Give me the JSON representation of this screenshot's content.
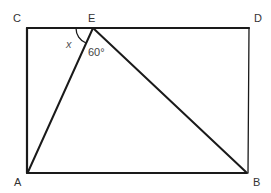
{
  "diagram": {
    "type": "geometry",
    "shape": "rectangle with inscribed triangle",
    "points": {
      "C": {
        "label": "C",
        "x": 27,
        "y": 28
      },
      "E": {
        "label": "E",
        "x": 93,
        "y": 28
      },
      "D": {
        "label": "D",
        "x": 249,
        "y": 28
      },
      "A": {
        "label": "A",
        "x": 27,
        "y": 173
      },
      "B": {
        "label": "B",
        "x": 247,
        "y": 173
      }
    },
    "segments": [
      "CD",
      "DB",
      "BA",
      "AC",
      "EA",
      "EB"
    ],
    "angles": {
      "x": {
        "label": "x",
        "vertex": "E",
        "between": [
          "EC",
          "EA"
        ]
      },
      "aeb": {
        "label": "60°",
        "vertex": "E",
        "between": [
          "EA",
          "EB"
        ]
      }
    },
    "colors": {
      "stroke": "#1a1a1a",
      "text": "#333333"
    }
  }
}
